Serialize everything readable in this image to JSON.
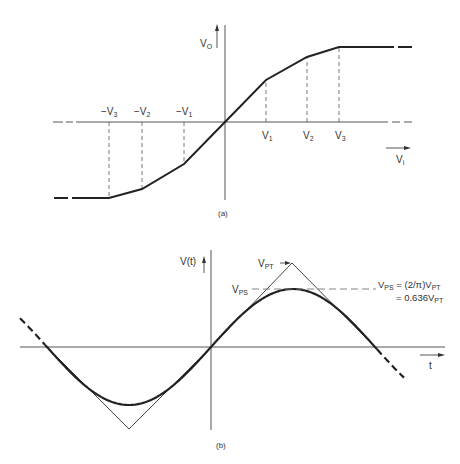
{
  "figure_a": {
    "caption": "(a)",
    "y_axis_label": {
      "main": "V",
      "sub": "O"
    },
    "x_axis_label": {
      "main": "V",
      "sub": "i"
    },
    "neg_labels": [
      {
        "main": "−V",
        "sub": "3"
      },
      {
        "main": "−V",
        "sub": "2"
      },
      {
        "main": "−V",
        "sub": "1"
      }
    ],
    "pos_labels": [
      {
        "main": "V",
        "sub": "1"
      },
      {
        "main": "V",
        "sub": "2"
      },
      {
        "main": "V",
        "sub": "3"
      }
    ],
    "description": "Piecewise-linear transfer characteristic Vo vs Vi with breakpoints at ±V1, ±V2, ±V3, saturating beyond ±V3"
  },
  "figure_b": {
    "caption": "(b)",
    "y_axis_label": "V(t)",
    "x_axis_label": "t",
    "vpt_label": {
      "main": "V",
      "sub": "PT"
    },
    "vps_label": {
      "main": "V",
      "sub": "PS"
    },
    "equation_line1": {
      "lhs_main": "V",
      "lhs_sub": "PS",
      "rhs_main": " = (2/π)V",
      "rhs_sub": "PT"
    },
    "equation_line2": {
      "main": "= 0.636V",
      "sub": "PT"
    },
    "description": "Triangle wave of peak VPT shaped into a sine wave of peak VPS"
  },
  "colors": {
    "line": "#222222",
    "thin_line": "#444444",
    "dash": "#555555",
    "text": "#333333",
    "background": "#ffffff"
  }
}
